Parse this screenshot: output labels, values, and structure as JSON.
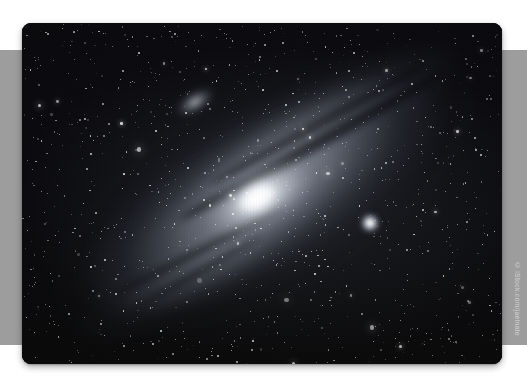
{
  "canvas": {
    "width": 527,
    "height": 387,
    "background": "#ffffff"
  },
  "band": {
    "name": "background-band",
    "color": "#9d9d9d",
    "top": 50,
    "height": 295
  },
  "photo": {
    "alt_title": "Andromeda Galaxy (M31) astrophotograph",
    "subject": "spiral galaxy with satellite galaxies in a dense star field",
    "palette": "monochrome / grayscale",
    "frame": {
      "x": 22,
      "y": 23,
      "width": 480,
      "height": 341,
      "corner_radius": 9
    },
    "background_color": "#07070a",
    "objects": [
      {
        "name": "galaxy-core",
        "label": "M31 nucleus",
        "cx": 234,
        "cy": 192,
        "brightness": "peak-white"
      },
      {
        "name": "satellite-galaxy-upper",
        "label": "M110",
        "cx": 173,
        "cy": 79,
        "brightness": "faint-diffuse"
      },
      {
        "name": "satellite-galaxy-lower",
        "label": "M32",
        "cx": 348,
        "cy": 200,
        "brightness": "compact-bright"
      }
    ]
  },
  "watermark": {
    "text": "© iStock.com/jaelnate",
    "orientation": "vertical",
    "color": "rgba(255,255,255,0.55)"
  }
}
